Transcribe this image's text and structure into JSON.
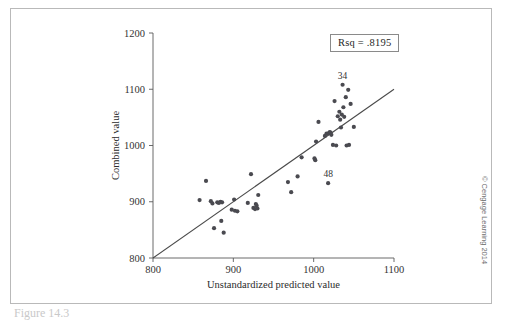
{
  "figure": {
    "credit": "© Cengage Learning 2014",
    "caption": "Figure 14.3"
  },
  "annotation_box": {
    "text": "Rsq = .8195"
  },
  "chart_data": {
    "type": "scatter",
    "title": "",
    "xlabel": "Unstandardized predicted value",
    "ylabel": "Combined value",
    "xlim": [
      800,
      1100
    ],
    "ylim": [
      800,
      1200
    ],
    "xticks": [
      800,
      900,
      1000,
      1100
    ],
    "yticks": [
      800,
      900,
      1000,
      1100,
      1200
    ],
    "grid": false,
    "legend": null,
    "rsq": 0.8195,
    "reference_line": {
      "type": "identity",
      "x": [
        800,
        1100
      ],
      "y": [
        800,
        1100
      ]
    },
    "point_labels": [
      {
        "label": "34",
        "x": 1036,
        "y": 1108
      },
      {
        "label": "48",
        "x": 1018,
        "y": 933
      }
    ],
    "points": [
      {
        "x": 858,
        "y": 903
      },
      {
        "x": 866,
        "y": 937
      },
      {
        "x": 872,
        "y": 901
      },
      {
        "x": 874,
        "y": 897
      },
      {
        "x": 876,
        "y": 853
      },
      {
        "x": 880,
        "y": 899
      },
      {
        "x": 882,
        "y": 898
      },
      {
        "x": 884,
        "y": 900
      },
      {
        "x": 885,
        "y": 866
      },
      {
        "x": 886,
        "y": 899
      },
      {
        "x": 888,
        "y": 845
      },
      {
        "x": 898,
        "y": 886
      },
      {
        "x": 901,
        "y": 904
      },
      {
        "x": 902,
        "y": 884
      },
      {
        "x": 905,
        "y": 883
      },
      {
        "x": 918,
        "y": 898
      },
      {
        "x": 922,
        "y": 949
      },
      {
        "x": 925,
        "y": 889
      },
      {
        "x": 927,
        "y": 887
      },
      {
        "x": 928,
        "y": 896
      },
      {
        "x": 929,
        "y": 893
      },
      {
        "x": 930,
        "y": 888
      },
      {
        "x": 931,
        "y": 912
      },
      {
        "x": 968,
        "y": 935
      },
      {
        "x": 972,
        "y": 917
      },
      {
        "x": 980,
        "y": 945
      },
      {
        "x": 985,
        "y": 979
      },
      {
        "x": 1001,
        "y": 977
      },
      {
        "x": 1002,
        "y": 974
      },
      {
        "x": 1003,
        "y": 1007
      },
      {
        "x": 1006,
        "y": 1042
      },
      {
        "x": 1014,
        "y": 1017
      },
      {
        "x": 1016,
        "y": 1021
      },
      {
        "x": 1018,
        "y": 933
      },
      {
        "x": 1019,
        "y": 1022
      },
      {
        "x": 1020,
        "y": 1024
      },
      {
        "x": 1021,
        "y": 1023
      },
      {
        "x": 1022,
        "y": 1019
      },
      {
        "x": 1024,
        "y": 1001
      },
      {
        "x": 1026,
        "y": 1079
      },
      {
        "x": 1028,
        "y": 1000
      },
      {
        "x": 1030,
        "y": 1052
      },
      {
        "x": 1032,
        "y": 1060
      },
      {
        "x": 1033,
        "y": 1046
      },
      {
        "x": 1034,
        "y": 1032
      },
      {
        "x": 1035,
        "y": 1055
      },
      {
        "x": 1036,
        "y": 1108
      },
      {
        "x": 1037,
        "y": 1068
      },
      {
        "x": 1038,
        "y": 1051
      },
      {
        "x": 1040,
        "y": 1086
      },
      {
        "x": 1041,
        "y": 1000
      },
      {
        "x": 1043,
        "y": 1099
      },
      {
        "x": 1044,
        "y": 1001
      },
      {
        "x": 1046,
        "y": 1074
      },
      {
        "x": 1050,
        "y": 1033
      }
    ]
  }
}
